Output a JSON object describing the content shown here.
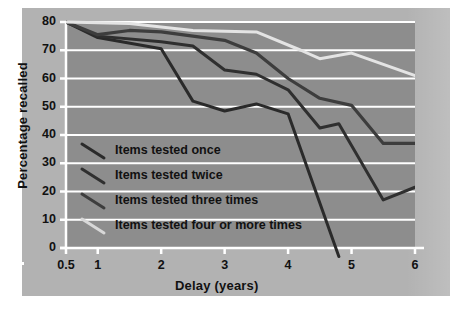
{
  "figure": {
    "background_color": "#ffffff",
    "board_color": "#b2b2b2",
    "plot_background_color": "#8d8d8d",
    "grid_color": "#ffffff",
    "axis_color": "#ffffff",
    "text_color": "#111111"
  },
  "chart_data": {
    "type": "line",
    "title": "",
    "xlabel": "Delay (years)",
    "ylabel": "Percentage recalled",
    "xlim": [
      0.5,
      6
    ],
    "ylim": [
      0,
      80
    ],
    "xticks": [
      0.5,
      1,
      2,
      3,
      4,
      5,
      6
    ],
    "xtick_labels": [
      "0.5",
      "1",
      "2",
      "3",
      "4",
      "5",
      "6"
    ],
    "yticks": [
      0,
      10,
      20,
      30,
      40,
      50,
      60,
      70,
      80
    ],
    "ytick_labels": [
      "0",
      "10",
      "20",
      "30",
      "40",
      "50",
      "60",
      "70",
      "80"
    ],
    "grid": "horizontal",
    "legend_position": "inside-lower-left",
    "series": [
      {
        "name": "Items tested once",
        "color": "#2a2a2a",
        "width": 3.0,
        "x": [
          0.5,
          1.0,
          2.0,
          2.5,
          3.0,
          3.5,
          4.0,
          4.8
        ],
        "y": [
          80,
          74.5,
          70.5,
          52.0,
          48.5,
          51.0,
          47.5,
          -3.0
        ]
      },
      {
        "name": "Items tested twice",
        "color": "#2f2f2f",
        "width": 3.0,
        "x": [
          0.5,
          1.0,
          2.0,
          2.5,
          3.0,
          3.5,
          4.0,
          4.5,
          4.8,
          5.5,
          6.0
        ],
        "y": [
          80,
          75.0,
          73.0,
          71.5,
          63.0,
          61.5,
          56.0,
          42.5,
          44.0,
          17.0,
          21.5
        ]
      },
      {
        "name": "Items tested three times",
        "color": "#3d3d3d",
        "width": 3.2,
        "x": [
          0.5,
          1.0,
          1.5,
          2.0,
          3.0,
          3.5,
          4.0,
          4.5,
          5.0,
          5.5,
          6.0
        ],
        "y": [
          80,
          75.5,
          77.0,
          76.5,
          73.5,
          69.0,
          60.0,
          53.0,
          50.5,
          37.0,
          37.0
        ]
      },
      {
        "name": "Items tested four or more times",
        "color": "#e4e4e4",
        "width": 3.0,
        "x": [
          0.5,
          1.5,
          2.5,
          3.5,
          4.2,
          4.5,
          5.0,
          6.0
        ],
        "y": [
          80,
          79.5,
          77.0,
          76.5,
          70.0,
          67.0,
          69.0,
          61.0
        ]
      }
    ]
  },
  "legend": {
    "entries": [
      {
        "label": "Items tested once",
        "color": "#2a2a2a"
      },
      {
        "label": "Items tested twice",
        "color": "#2f2f2f"
      },
      {
        "label": "Items tested three times",
        "color": "#3d3d3d"
      },
      {
        "label": "Items tested four or more times",
        "color": "#d8d8d8"
      }
    ]
  }
}
